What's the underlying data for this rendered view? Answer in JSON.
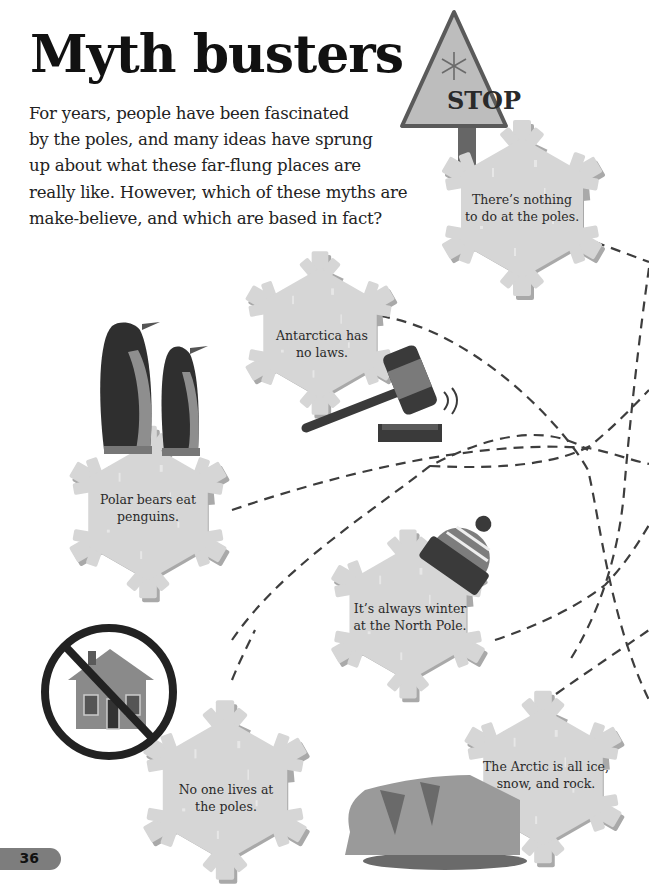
{
  "header": {
    "title": "Myth busters",
    "intro_lines": [
      "For years, people have been fascinated",
      "by the poles, and many ideas have sprung",
      "up about what these far-flung places are",
      "really like. However, which of these myths are",
      "make-believe, and which are based in fact?"
    ]
  },
  "sign": {
    "label": "STOP",
    "icon": "snowflake-icon"
  },
  "myths": [
    {
      "id": "nothing-to-do",
      "lines": [
        "There’s nothing",
        "to do at the poles."
      ],
      "illustration": "stop-sign"
    },
    {
      "id": "no-laws",
      "lines": [
        "Antarctica has",
        "no laws."
      ],
      "illustration": "gavel-icon"
    },
    {
      "id": "polar-bears",
      "lines": [
        "Polar bears eat",
        "penguins."
      ],
      "illustration": "penguins"
    },
    {
      "id": "always-winter",
      "lines": [
        "It’s always winter",
        "at the North Pole."
      ],
      "illustration": "woolly-hat-icon"
    },
    {
      "id": "no-one-lives",
      "lines": [
        "No one lives at",
        "the poles."
      ],
      "illustration": "no-house-icon"
    },
    {
      "id": "arctic-ice",
      "lines": [
        "The Arctic is all ice,",
        "snow, and rock."
      ],
      "illustration": "iceberg"
    }
  ],
  "footer": {
    "page_number": "36"
  },
  "colors": {
    "snowflake": "#d6d6d6",
    "snowflake_shadow": "#a9a9a9",
    "dark": "#3a3a3a",
    "mid": "#7d7d7d",
    "sign": "#b5b5b5"
  }
}
